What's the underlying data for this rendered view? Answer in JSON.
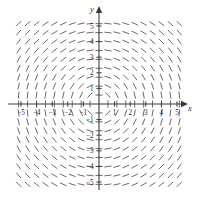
{
  "chart_data": {
    "type": "scatter",
    "plot_kind": "slope-field",
    "title": "",
    "subtitle": "",
    "xlabel": "x",
    "ylabel": "y",
    "xlim": [
      -5.5,
      5.5
    ],
    "ylim": [
      -5.5,
      5.5
    ],
    "grid": false,
    "legend": null,
    "annotations": [],
    "x_ticks": [
      -5,
      -4,
      -3,
      -2,
      -1,
      1,
      2,
      3,
      4,
      5
    ],
    "y_ticks": [
      -5,
      -4,
      -3,
      -2,
      -1,
      1,
      2,
      3,
      4,
      5
    ],
    "x_tick_labels": [
      "-5",
      "-4",
      "-3",
      "-2",
      "-1",
      "1",
      "2",
      "3",
      "4",
      "5"
    ],
    "y_tick_labels": [
      "-5",
      "-4",
      "-3",
      "-2",
      "-1",
      "1",
      "2",
      "3",
      "4",
      "5"
    ],
    "sample_x": [
      -5,
      -4.444,
      -3.889,
      -3.333,
      -2.778,
      -2.222,
      -1.667,
      -1.111,
      -0.556,
      0,
      0.556,
      1.111,
      1.667,
      2.222,
      2.778,
      3.333,
      3.889,
      4.444,
      5
    ],
    "sample_y": [
      5,
      4.444,
      3.889,
      3.333,
      2.778,
      2.222,
      1.667,
      1.111,
      0.556,
      0,
      -0.556,
      -1.111,
      -1.667,
      -2.222,
      -2.778,
      -3.333,
      -3.889,
      -4.444,
      -5
    ],
    "slope_formula": "dy/dx = -x/y",
    "segment_length": 7.2,
    "segment_color": "#6b6b6b",
    "axis_color": "#3a3a3a"
  },
  "axes": {
    "x_axis_label": "x",
    "y_axis_label": "y"
  },
  "colors": {
    "background": "#ffffff",
    "segment": "#6b6b6b",
    "axis": "#3a3a3a",
    "tick_label": "#2a2a2a"
  }
}
